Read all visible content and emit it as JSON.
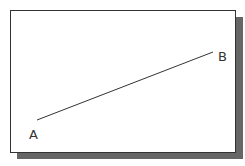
{
  "diagram": {
    "points": [
      {
        "label": "A",
        "x": 37,
        "y": 120
      },
      {
        "label": "B",
        "x": 213,
        "y": 52
      }
    ],
    "line_color": "#333333",
    "border_color": "#333333",
    "shadow_color": "#666666"
  }
}
